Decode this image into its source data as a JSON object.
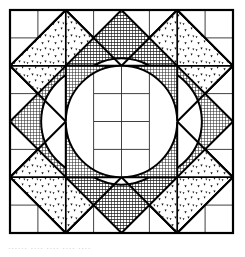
{
  "figure": {
    "name": "geometric-quilt-block-pattern",
    "canvas": {
      "width": 245,
      "height": 257
    },
    "block": {
      "x": 10,
      "y": 10,
      "width": 223,
      "height": 223
    },
    "grid": {
      "divisions": 8,
      "cell": 27.875,
      "visible": true
    },
    "colors": {
      "background": "#ffffff",
      "ink": "#111111",
      "outline": "#000000",
      "grid_line": "#2b2b2b",
      "dark_fill": "#6e6e6e",
      "dark_fill_dense": "#4a4a4a",
      "stipple_fill": "#ffffff",
      "stipple_dot": "#111111"
    },
    "stroke": {
      "outer_border": 2.2,
      "shape_outline": 2.0,
      "grid": 0.9
    },
    "elements": {
      "corner_diamonds": {
        "label": "stippled corner diamond",
        "count": 4,
        "fill": "stipple",
        "positions": [
          "top-left",
          "top-right",
          "bottom-left",
          "bottom-right"
        ]
      },
      "edge_triangles": {
        "label": "dark crosshatch edge triangle",
        "count": 4,
        "fill": "crosshatch-dense",
        "positions": [
          "top-center",
          "bottom-center"
        ]
      },
      "side_diamonds": {
        "label": "dark crosshatch side diamond",
        "count": 2,
        "fill": "crosshatch",
        "positions": [
          "left-center",
          "right-center"
        ]
      },
      "arc_petals": {
        "label": "dark curved petal",
        "count": 4,
        "fill": "crosshatch",
        "positions": [
          "inner-top-left",
          "inner-top-right",
          "inner-bottom-left",
          "inner-bottom-right"
        ]
      },
      "center": {
        "label": "white astroid center",
        "fill": "background"
      }
    },
    "caption": "······ ···· ···· ···· ····"
  }
}
